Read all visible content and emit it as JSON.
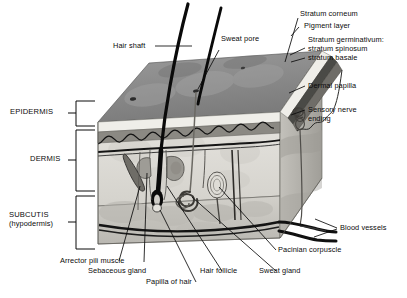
{
  "figure": {
    "background_color": "#ffffff",
    "line_color": "#0b0b0b",
    "style": "grayscale anatomical illustration"
  },
  "layer_brackets": [
    {
      "id": "epidermis",
      "label": "EPIDERMIS"
    },
    {
      "id": "dermis",
      "label": "DERMIS"
    },
    {
      "id": "subcutis",
      "label": "SUBCUTIS",
      "label2": "(hypodermis)"
    }
  ],
  "callouts": {
    "hair_shaft": "Hair shaft",
    "sweat_pore": "Sweat pore",
    "stratum_corneum": "Stratum corneum",
    "pigment_layer": "Pigment layer",
    "stratum_germinativum": "Stratum germinativum:",
    "stratum_spinosum": "stratum spinosum",
    "stratum_basale": "stratum basale",
    "dermal_papilla": "Dermal papilla",
    "sensory_nerve_1": "Sensory nerve",
    "sensory_nerve_2": "ending",
    "blood_vessels": "Blood vessels",
    "pacinian_corpuscle": "Pacinian corpuscle",
    "sweat_gland": "Sweat gland",
    "hair_follicle": "Hair follicle",
    "papilla_of_hair": "Papilla of hair",
    "sebaceous_gland": "Sebaceous gland",
    "arrector_pili_muscle": "Arrector pili muscle"
  },
  "palette": {
    "surface_gray": "#8d8d8d",
    "surface_gray_dark": "#6f6f6f",
    "epidermis_light": "#e8e6e1",
    "epidermis_band": "#9a9892",
    "dermis_fill": "#dedcd7",
    "subcutis_fill": "#c9c7c1",
    "side_face": "#b0aea8",
    "structure_dark": "#111111",
    "outline": "#0b0b0b"
  }
}
